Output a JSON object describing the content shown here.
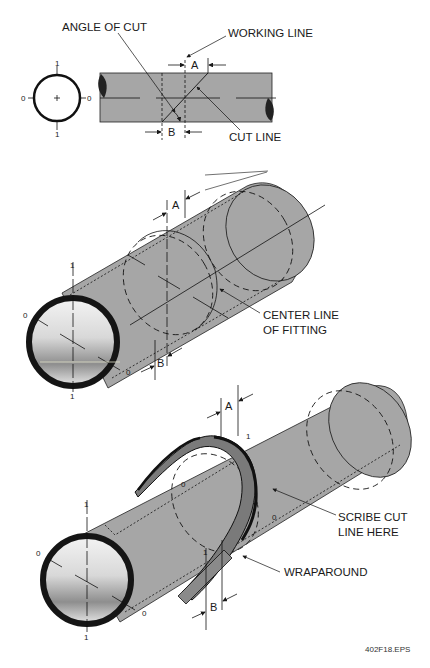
{
  "figure_id": "402F18.EPS",
  "colors": {
    "pipe_fill": "#a6a6a6",
    "pipe_dark": "#8a8a8a",
    "wrap_fill": "#7a7a7a",
    "outline": "#1a1a1a",
    "background": "#ffffff"
  },
  "top_view": {
    "labels": {
      "angle_of_cut": "ANGLE OF CUT",
      "working_line": "WORKING LINE",
      "cut_line": "CUT LINE",
      "dim_a": "A",
      "dim_b": "B"
    },
    "circle_marks": {
      "top": "1",
      "bottom": "1",
      "left": "0",
      "right": "0"
    }
  },
  "middle_view": {
    "labels": {
      "center_line": "CENTER LINE",
      "of_fitting": "OF FITTING",
      "dim_a": "A",
      "dim_b": "B"
    },
    "marks": {
      "top": "1",
      "left": "0",
      "bottom": "1",
      "bottom_right": "0"
    }
  },
  "bottom_view": {
    "labels": {
      "scribe_cut": "SCRIBE CUT",
      "line_here": "LINE HERE",
      "wraparound": "WRAPAROUND",
      "dim_a": "A",
      "dim_b": "B"
    },
    "marks": {
      "pipe_top": "1",
      "pipe_left": "0",
      "pipe_bottom": "1",
      "pipe_bottom_right": "0",
      "wrap_top": "1",
      "wrap_inner_0": "0",
      "wrap_right_0": "0",
      "wrap_bottom_1": "1"
    }
  }
}
